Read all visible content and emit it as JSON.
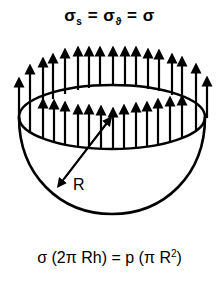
{
  "diagram": {
    "title_equation": {
      "sigma": "σ",
      "sub_s": "s",
      "equals": " = ",
      "sub_theta": "ϑ",
      "rhs": "σ"
    },
    "radius_label": "R",
    "balance_equation": {
      "left": "σ (2π Rh) = p (π R",
      "exponent": "2",
      "close": ")"
    },
    "colors": {
      "stroke": "#000000",
      "background": "#ffffff"
    },
    "elements": {
      "rim_ellipse": {
        "cx": 112,
        "cy": 117,
        "rx": 93,
        "ry": 32
      },
      "hemisphere_bottom_y": 214,
      "radius_arrow": {
        "from": [
          113,
          115
        ],
        "to": [
          57,
          188
        ]
      },
      "back_arrows_x": [
        19,
        30,
        43,
        53,
        65,
        78,
        89,
        100,
        113,
        125,
        136,
        148,
        159,
        172,
        182,
        196,
        207
      ],
      "front_arrows_x": [
        43,
        54,
        65,
        78,
        89,
        101,
        113,
        124,
        136,
        147,
        158,
        170,
        182
      ]
    }
  }
}
